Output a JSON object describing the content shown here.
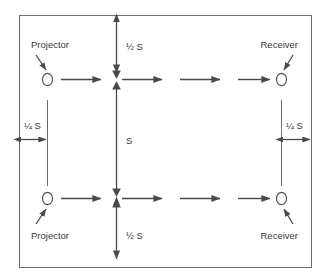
{
  "diagram": {
    "frame": {
      "border_color": "#6f6f6f",
      "background": "#ffffff"
    },
    "stroke_color": "#4a4a4a",
    "text_color": "#3a3a3a",
    "node_glyph": "O",
    "nodes": [
      {
        "id": "top-left-projector",
        "label": "Projector",
        "role": "projector",
        "position": "top-left"
      },
      {
        "id": "top-right-receiver",
        "label": "Receiver",
        "role": "receiver",
        "position": "top-right"
      },
      {
        "id": "bottom-left-projector",
        "label": "Projector",
        "role": "projector",
        "position": "bottom-left"
      },
      {
        "id": "bottom-right-receiver",
        "label": "Receiver",
        "role": "receiver",
        "position": "bottom-right"
      }
    ],
    "dimensions": [
      {
        "id": "top-half-s",
        "label": "½ S",
        "orientation": "vertical",
        "location": "top-center"
      },
      {
        "id": "full-s",
        "label": "S",
        "orientation": "vertical",
        "location": "center"
      },
      {
        "id": "bottom-half-s",
        "label": "½ S",
        "orientation": "vertical",
        "location": "bottom-center"
      },
      {
        "id": "left-quarter-s",
        "label": "¼ S",
        "orientation": "horizontal",
        "location": "left"
      },
      {
        "id": "right-quarter-s",
        "label": "¼ S",
        "orientation": "horizontal",
        "location": "right"
      }
    ],
    "flow_arrows": {
      "top_row_count": 4,
      "bottom_row_count": 4,
      "direction": "left-to-right"
    }
  }
}
